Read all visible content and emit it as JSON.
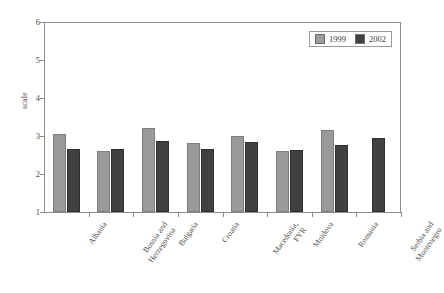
{
  "chart_data": {
    "type": "bar",
    "title": "",
    "xlabel": "",
    "ylabel": "scale",
    "ylim": [
      1,
      6
    ],
    "yticks": [
      1,
      2,
      3,
      4,
      5,
      6
    ],
    "grid": false,
    "legend_position": "top-right",
    "categories": [
      "Albania",
      "Bosnia and\nHerzegovina",
      "Bulgaria",
      "Croatia",
      "Macedonia,\nFYR",
      "Moldova",
      "Romania",
      "Serbia and\nMontenegro"
    ],
    "series": [
      {
        "name": "1999",
        "color": "#9a9a9a",
        "values": [
          3.05,
          2.6,
          3.2,
          2.82,
          3.0,
          2.6,
          3.15,
          null
        ]
      },
      {
        "name": "2002",
        "color": "#414141",
        "values": [
          2.65,
          2.66,
          2.87,
          2.66,
          2.85,
          2.63,
          2.76,
          2.95
        ]
      }
    ]
  },
  "legend": {
    "entries": [
      {
        "label": "1999"
      },
      {
        "label": "2002"
      }
    ]
  },
  "axis": {
    "y_label": "scale",
    "y_ticks": [
      "6",
      "5",
      "4",
      "3",
      "2",
      "1"
    ]
  }
}
